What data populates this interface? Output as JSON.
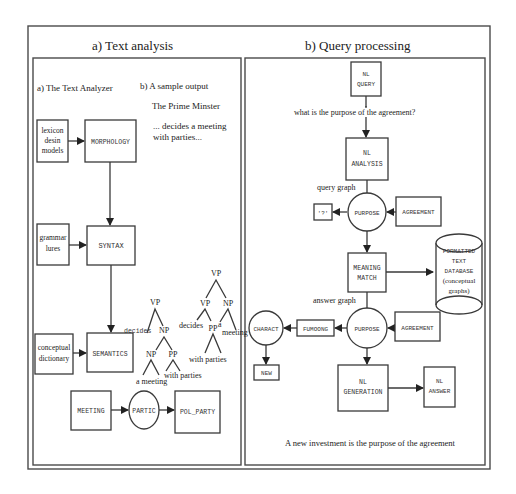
{
  "panel_a": {
    "title": "a)   Text analysis",
    "subtitle_analyzer": "a) The Text Analyzer",
    "subtitle_sample": "b)  A sample output",
    "sample_line1": "The Prime Minster",
    "sample_line2": "... decides a meeting",
    "sample_line3": "with parties...",
    "lexicon": [
      "lexicon",
      "desin",
      "models"
    ],
    "morphology": "MORPHOLOGY",
    "grammar": [
      "grammar",
      "lures"
    ],
    "syntax": "SYNTAX",
    "conceptual": [
      "conceptual",
      "dictionary"
    ],
    "semantics": "SEMANTICS",
    "graph": {
      "meeting": "MEETING",
      "partic": "PARTIC",
      "pol_party": "POL_PARTY"
    },
    "tree1": {
      "root": "VP",
      "decides": "decides",
      "np": "NP",
      "np2": "NP",
      "pp": "PP",
      "a_meeting": "a meeting",
      "with_parties": "with parties"
    },
    "tree2": {
      "root": "VP",
      "vp": "VP",
      "np": "NP",
      "decides": "decides",
      "pp": "PP",
      "a": "a",
      "meeting": "meeting",
      "with_parties": "with parties"
    }
  },
  "panel_b": {
    "title": "b)   Query processing",
    "nl_query": [
      "NL",
      "QUERY"
    ],
    "question": "what is the purpose of the agreement?",
    "nl_analysis": [
      "NL",
      "ANALYSIS"
    ],
    "query_graph_label": "query graph",
    "unknown": "'?'",
    "purpose_1": "PURPOSE",
    "agreement_1": "AGREEMENT",
    "meaning_match": [
      "MEANING",
      "MATCH"
    ],
    "database": [
      "FORMATTED",
      "TEXT",
      "DATABASE",
      "(conceptual",
      "graphs)"
    ],
    "answer_graph_label": "answer graph",
    "charact": "CHARACT",
    "fumoong": "FUMOONG",
    "purpose_2": "PURPOSE",
    "agreement_2": "AGREEMENT",
    "new": "NEW",
    "nl_generation": [
      "NL",
      "GENERATION"
    ],
    "nl_answer": [
      "NL",
      "ANSWER"
    ],
    "answer_sentence": "A new investment is the purpose of the agreement"
  }
}
